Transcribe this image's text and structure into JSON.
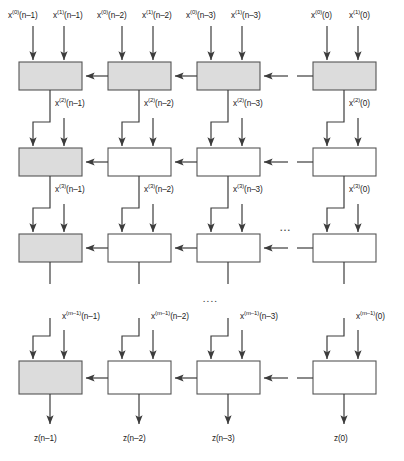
{
  "figure": {
    "caption": "",
    "colors": {
      "cell_shaded_fill": "#dcdcdc",
      "cell_plain_fill": "#ffffff",
      "cell_border": "#555555",
      "line": "#3c3c3c",
      "text": "#1c1c1c"
    },
    "ellipsis_horizontal": "...",
    "ellipsis_vertical": "....",
    "columns": [
      {
        "index": 0,
        "time": "n-1"
      },
      {
        "index": 1,
        "time": "n-2"
      },
      {
        "index": 2,
        "time": "n-3"
      },
      {
        "index": 3,
        "time": "0"
      }
    ],
    "top_inputs": [
      {
        "a": "x(0)(n–1)",
        "b": "x(1)(n–1)"
      },
      {
        "a": "x(0)(n–2)",
        "b": "x(1)(n–2)"
      },
      {
        "a": "x(0)(n–3)",
        "b": "x(1)(n–3)"
      },
      {
        "a": "x(0)(0)",
        "b": "x(1)(0)"
      }
    ],
    "inter_labels_row1": [
      "x(2)(n–1)",
      "x(2)(n–2)",
      "x(2)(n–3)",
      "x(2)(0)"
    ],
    "inter_labels_row2": [
      "x(3)(n–1)",
      "x(3)(n–2)",
      "x(3)(n–3)",
      "x(3)(0)"
    ],
    "inter_labels_row4": [
      "x(m–1)(n–1)",
      "x(m–1)(n–2)",
      "x(m–1)(n–3)",
      "x(m–1)(0)"
    ],
    "outputs": [
      "z(n–1)",
      "z(n–2)",
      "z(n–3)",
      "z(0)"
    ],
    "rows": [
      {
        "index": 0,
        "shaded": [
          true,
          true,
          true,
          true
        ]
      },
      {
        "index": 1,
        "shaded": [
          true,
          false,
          false,
          false
        ]
      },
      {
        "index": 2,
        "shaded": [
          true,
          false,
          false,
          false
        ]
      },
      {
        "index": 3,
        "shaded": [
          true,
          false,
          false,
          false
        ]
      }
    ]
  }
}
